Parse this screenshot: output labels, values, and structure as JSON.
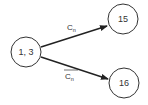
{
  "diagram": {
    "type": "state-transition",
    "nodes": [
      {
        "id": "n13",
        "label": "1, 3",
        "cx": 26,
        "cy": 52,
        "r": 15
      },
      {
        "id": "n15",
        "label": "15",
        "cx": 123,
        "cy": 19,
        "r": 15
      },
      {
        "id": "n16",
        "label": "16",
        "cx": 124,
        "cy": 83,
        "r": 15
      }
    ],
    "edges": [
      {
        "from": "n13",
        "to": "n15",
        "label_main": "C",
        "label_sub": "n",
        "negated": false
      },
      {
        "from": "n13",
        "to": "n16",
        "label_main": "C",
        "label_sub": "n",
        "negated": true
      }
    ],
    "colors": {
      "stroke": "#333333",
      "background": "#ffffff"
    }
  }
}
